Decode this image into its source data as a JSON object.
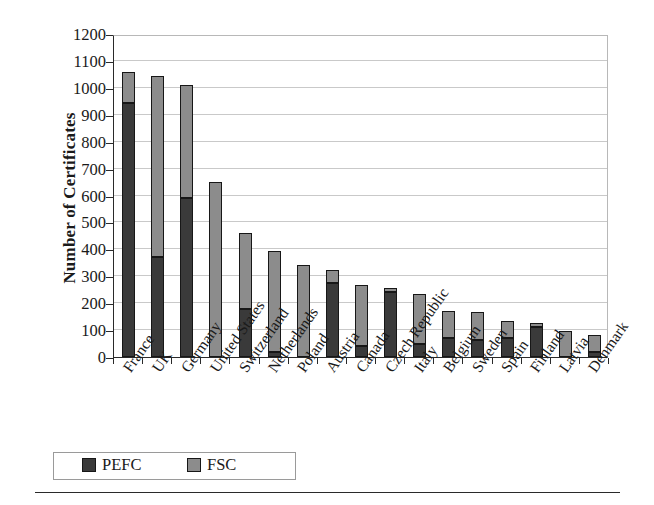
{
  "chart_data": {
    "type": "bar",
    "subtype": "stacked-vertical",
    "title": "",
    "xlabel": "",
    "ylabel": "Number of Certificates",
    "ylim": [
      0,
      1200
    ],
    "ytick_step": 100,
    "yticks": [
      1200,
      1100,
      1000,
      900,
      800,
      700,
      600,
      500,
      400,
      300,
      200,
      100,
      0
    ],
    "grid": true,
    "grid_axis": "y",
    "legend_position": "below-plot-left",
    "categories": [
      "France",
      "UK",
      "Germany",
      "United States",
      "Switzerland",
      "Netherlands",
      "Poland",
      "Austria",
      "Canada",
      "Czech Republic",
      "Italy",
      "Belgium",
      "Sweden",
      "Spain",
      "Finland",
      "Latvia",
      "Denmark"
    ],
    "series": [
      {
        "name": "PEFC",
        "color": "#3a3a3a",
        "values": [
          945,
          370,
          590,
          0,
          180,
          20,
          0,
          275,
          40,
          240,
          50,
          72,
          65,
          72,
          112,
          0,
          18
        ]
      },
      {
        "name": "FSC",
        "color": "#8c8c8c",
        "values": [
          115,
          675,
          420,
          650,
          280,
          375,
          340,
          50,
          228,
          15,
          185,
          98,
          103,
          63,
          13,
          95,
          62
        ]
      }
    ],
    "totals": [
      1060,
      1045,
      1010,
      650,
      460,
      395,
      340,
      325,
      268,
      255,
      235,
      170,
      168,
      135,
      125,
      95,
      80
    ]
  },
  "legend": {
    "items": [
      {
        "label": "PEFC",
        "color": "#3a3a3a"
      },
      {
        "label": "FSC",
        "color": "#8c8c8c"
      }
    ]
  }
}
